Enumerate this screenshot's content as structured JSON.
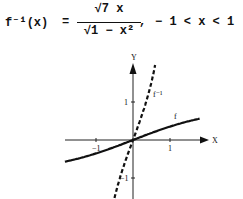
{
  "formula": {
    "lhs": "f⁻¹(x)",
    "equals": "=",
    "numerator": "√7 x",
    "denominator": "√1 − x²",
    "comma": ",",
    "domain": "− 1 < x < 1"
  },
  "chart_data": {
    "type": "line",
    "title": "",
    "xlabel": "X",
    "ylabel": "Y",
    "xlim": [
      -1.85,
      2.0
    ],
    "ylim": [
      -1.6,
      2.1
    ],
    "x_ticks": [
      -1,
      1
    ],
    "y_ticks": [
      1,
      -1
    ],
    "series": [
      {
        "name": "f",
        "style": "solid",
        "formula": "x / sqrt(x^2 + 7)",
        "x": [
          -1.84,
          -1.5,
          -1.0,
          -0.5,
          0,
          0.5,
          1.0,
          1.5,
          1.81
        ],
        "y": [
          -0.57,
          -0.49,
          -0.35,
          -0.19,
          0,
          0.19,
          0.35,
          0.49,
          0.57
        ]
      },
      {
        "name": "f⁻¹",
        "style": "dashed",
        "formula": "sqrt(7) x / sqrt(1 - x^2)",
        "x": [
          -0.5,
          -0.4,
          -0.2,
          0,
          0.2,
          0.4,
          0.6
        ],
        "y": [
          -1.53,
          -1.15,
          -0.54,
          0,
          0.54,
          1.15,
          1.98
        ]
      }
    ],
    "labels": {
      "f": "f",
      "f_inverse": "f⁻¹",
      "x_tick_neg": "−1",
      "x_tick_pos": "1",
      "y_tick_pos": "1",
      "y_tick_neg": "−1"
    },
    "grid": false,
    "legend": "none"
  }
}
